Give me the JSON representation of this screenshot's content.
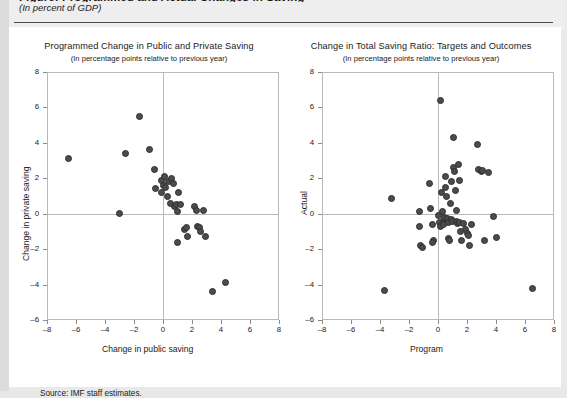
{
  "figure": {
    "title_cut": "Figure: Programmed and Actual Changes in Saving",
    "subtitle": "(In percent of GDP)",
    "source": "Source: IMF staff estimates."
  },
  "charts": [
    {
      "id": "left",
      "title": "Programmed Change in Public and Private Saving",
      "subtitle": "(In percentage points relative to previous year)",
      "xlabel": "Change in public saving",
      "ylabel": "Change in private saving",
      "xticks": [
        "–8",
        "–6",
        "–4",
        "–2",
        "0",
        "2",
        "4",
        "6",
        "8"
      ],
      "yticks": [
        "8",
        "6",
        "4",
        "2",
        "0",
        "–2",
        "–4",
        "–6"
      ]
    },
    {
      "id": "right",
      "title": "Change in Total Saving Ratio: Targets and Outcomes",
      "subtitle": "(In percentage points relative to previous year)",
      "xlabel": "Program",
      "ylabel": "Actual",
      "xticks": [
        "–8",
        "–6",
        "–4",
        "–2",
        "0",
        "2",
        "4",
        "6",
        "8"
      ],
      "yticks": [
        "8",
        "6",
        "4",
        "2",
        "0",
        "–2",
        "–4",
        "–6"
      ]
    }
  ],
  "chart_data": [
    {
      "type": "scatter",
      "id": "left",
      "title": "Programmed Change in Public and Private Saving",
      "subtitle": "(In percentage points relative to previous year)",
      "xlabel": "Change in public saving",
      "ylabel": "Change in private saving",
      "xlim": [
        -8,
        8
      ],
      "ylim": [
        -6,
        8
      ],
      "xticks": [
        -8,
        -6,
        -4,
        -2,
        0,
        2,
        4,
        6,
        8
      ],
      "yticks": [
        -6,
        -4,
        -2,
        0,
        2,
        4,
        6,
        8
      ],
      "grid": false,
      "legend": "none",
      "marker_color": "#4c4c4c",
      "points": [
        [
          -6.5,
          3.1
        ],
        [
          -3.0,
          0.0
        ],
        [
          -2.6,
          3.4
        ],
        [
          -1.6,
          5.5
        ],
        [
          -0.9,
          3.6
        ],
        [
          -0.6,
          2.5
        ],
        [
          -0.5,
          1.4
        ],
        [
          -0.1,
          1.9
        ],
        [
          -0.1,
          1.2
        ],
        [
          0.0,
          1.6
        ],
        [
          0.1,
          2.1
        ],
        [
          0.2,
          1.5
        ],
        [
          0.3,
          1.0
        ],
        [
          0.4,
          1.8
        ],
        [
          0.5,
          0.6
        ],
        [
          0.6,
          2.0
        ],
        [
          0.7,
          1.7
        ],
        [
          0.8,
          0.4
        ],
        [
          0.9,
          0.5
        ],
        [
          1.0,
          0.1
        ],
        [
          1.1,
          1.2
        ],
        [
          1.2,
          0.5
        ],
        [
          1.5,
          -0.9
        ],
        [
          1.6,
          -0.8
        ],
        [
          1.7,
          -1.3
        ],
        [
          2.2,
          0.4
        ],
        [
          2.3,
          0.2
        ],
        [
          2.4,
          -0.7
        ],
        [
          2.5,
          -0.8
        ],
        [
          2.6,
          -1.0
        ],
        [
          2.8,
          0.2
        ],
        [
          2.9,
          -1.3
        ],
        [
          1.0,
          -1.6
        ],
        [
          3.4,
          -4.4
        ],
        [
          4.3,
          -3.9
        ]
      ]
    },
    {
      "type": "scatter",
      "id": "right",
      "title": "Change in Total Saving Ratio: Targets and Outcomes",
      "subtitle": "(In percentage points relative to previous year)",
      "xlabel": "Program",
      "ylabel": "Actual",
      "xlim": [
        -8,
        8
      ],
      "ylim": [
        -6,
        8
      ],
      "xticks": [
        -8,
        -6,
        -4,
        -2,
        0,
        2,
        4,
        6,
        8
      ],
      "yticks": [
        -6,
        -4,
        -2,
        0,
        2,
        4,
        6,
        8
      ],
      "grid": false,
      "legend": "none",
      "marker_color": "#4c4c4c",
      "points": [
        [
          -3.2,
          0.85
        ],
        [
          -3.7,
          -4.35
        ],
        [
          -1.3,
          0.1
        ],
        [
          -1.3,
          -0.7
        ],
        [
          -1.2,
          -1.8
        ],
        [
          -1.1,
          -1.9
        ],
        [
          -0.6,
          1.7
        ],
        [
          -0.5,
          0.3
        ],
        [
          -0.4,
          -0.6
        ],
        [
          -0.3,
          -1.5
        ],
        [
          -0.35,
          -1.6
        ],
        [
          0.0,
          -0.1
        ],
        [
          0.1,
          -0.5
        ],
        [
          0.15,
          -0.7
        ],
        [
          0.2,
          6.4
        ],
        [
          0.25,
          1.2
        ],
        [
          0.3,
          0.1
        ],
        [
          0.35,
          -0.4
        ],
        [
          0.4,
          -0.6
        ],
        [
          0.45,
          -0.2
        ],
        [
          0.5,
          2.1
        ],
        [
          0.55,
          1.5
        ],
        [
          0.6,
          1.0
        ],
        [
          0.65,
          -0.25
        ],
        [
          0.7,
          -0.5
        ],
        [
          0.75,
          -1.4
        ],
        [
          0.8,
          -1.5
        ],
        [
          0.85,
          0.6
        ],
        [
          0.9,
          1.8
        ],
        [
          0.95,
          -0.3
        ],
        [
          1.0,
          -0.45
        ],
        [
          1.05,
          2.6
        ],
        [
          1.1,
          4.3
        ],
        [
          1.15,
          2.4
        ],
        [
          1.2,
          1.3
        ],
        [
          1.25,
          0.2
        ],
        [
          1.3,
          -0.45
        ],
        [
          1.35,
          -0.55
        ],
        [
          1.4,
          2.8
        ],
        [
          1.45,
          1.9
        ],
        [
          1.5,
          -0.5
        ],
        [
          1.55,
          -1.0
        ],
        [
          1.6,
          -1.5
        ],
        [
          1.75,
          -0.55
        ],
        [
          1.9,
          -0.9
        ],
        [
          2.0,
          -1.1
        ],
        [
          2.1,
          -1.25
        ],
        [
          2.2,
          -1.8
        ],
        [
          2.3,
          -0.6
        ],
        [
          2.7,
          3.9
        ],
        [
          2.8,
          2.5
        ],
        [
          3.0,
          2.4
        ],
        [
          3.1,
          2.45
        ],
        [
          3.2,
          -1.5
        ],
        [
          3.5,
          2.35
        ],
        [
          3.8,
          -0.15
        ],
        [
          4.0,
          -1.35
        ],
        [
          6.5,
          -4.2
        ]
      ]
    }
  ]
}
